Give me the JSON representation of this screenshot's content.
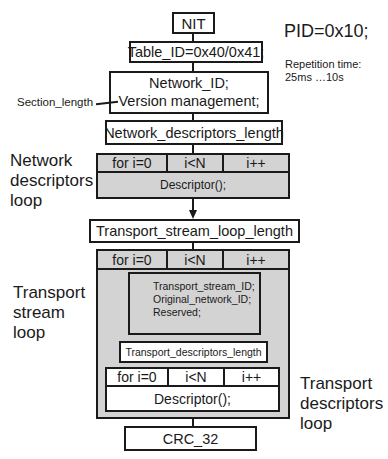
{
  "header": {
    "nit": "NIT",
    "table_id": "Table_ID=0x40/0x41;",
    "pid": "PID=0x10;",
    "repetition_line1": "Repetition time:",
    "repetition_line2": "25ms …10s"
  },
  "network_block": {
    "line1": "Network_ID;",
    "line2": "Version management;",
    "side_label": "Section_length"
  },
  "network_descriptors_length": "Network_descriptors_length",
  "network_loop": {
    "label_line1": "Network",
    "label_line2": "descriptors",
    "label_line3": "loop",
    "init": "for i=0",
    "cond": "i<N",
    "incr": "i++",
    "body": "Descriptor();"
  },
  "transport_stream_loop_length": "Transport_stream_loop_length",
  "transport_loop": {
    "label_line1": "Transport",
    "label_line2": "stream",
    "label_line3": "loop",
    "init": "for i=0",
    "cond": "i<N",
    "incr": "i++",
    "fields": [
      "Transport_stream_ID;",
      "Original_network_ID;",
      "Reserved;"
    ],
    "descriptors_length": "Transport_descriptors_length"
  },
  "transport_desc_loop": {
    "label_line1": "Transport",
    "label_line2": "descriptors",
    "label_line3": "loop",
    "init": "for i=0",
    "cond": "i<N",
    "incr": "i++",
    "body": "Descriptor();"
  },
  "crc": "CRC_32",
  "colors": {
    "loop_fill": "#d3d3d3",
    "line": "#1a1a1a",
    "box_fill": "#ffffff"
  }
}
